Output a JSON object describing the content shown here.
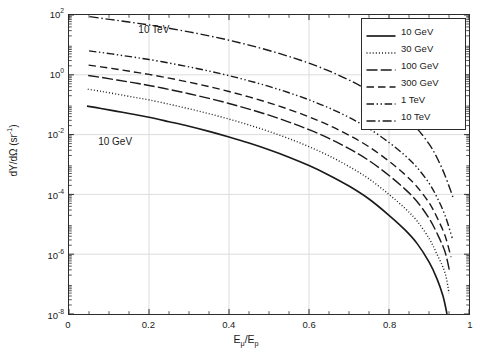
{
  "chart_data": {
    "type": "line",
    "title": "",
    "xlabel": "E_mu / E_p",
    "xlabel_main": "E",
    "xlabel_sub1": "μ",
    "xlabel_mid": "/E",
    "xlabel_sub2": "p",
    "ylabel": "dY/dΩ (sr^-1)",
    "ylabel_main": "dY/dΩ (sr",
    "ylabel_sup": "-1",
    "ylabel_tail": ")",
    "xlim": [
      0,
      1
    ],
    "ylim": [
      1e-08,
      100
    ],
    "yscale": "log",
    "xscale": "linear",
    "grid": true,
    "grid_color": "#d9d9d9",
    "axis_color": "#2b2b2b",
    "line_color": "#1a1a1a",
    "background": "#ffffff",
    "legend_position": "top-right",
    "xticks": [
      0,
      0.2,
      0.4,
      0.6,
      0.8,
      1
    ],
    "xtick_labels": [
      "0",
      "0.2",
      "0.4",
      "0.6",
      "0.8",
      "1"
    ],
    "yticks": [
      100,
      1,
      0.01,
      0.0001,
      1e-06,
      1e-08
    ],
    "ytick_labels": [
      "10",
      "10",
      "10",
      "10",
      "10",
      "10"
    ],
    "ytick_exponents": [
      "2",
      "0",
      "-2",
      "-4",
      "-6",
      "-8"
    ],
    "annotations": [
      {
        "text": "10 TeV",
        "x": 0.175,
        "y": 30.0
      },
      {
        "text": "10 GeV",
        "x": 0.075,
        "y": 0.0055
      }
    ],
    "series": [
      {
        "name": "10 GeV",
        "dash": "solid",
        "x": [
          0.045,
          0.08,
          0.12,
          0.16,
          0.2,
          0.25,
          0.3,
          0.35,
          0.4,
          0.45,
          0.5,
          0.55,
          0.6,
          0.65,
          0.7,
          0.75,
          0.8,
          0.84,
          0.87,
          0.9,
          0.92,
          0.935,
          0.945
        ],
        "values": [
          0.09,
          0.075,
          0.06,
          0.048,
          0.038,
          0.027,
          0.019,
          0.0128,
          0.0083,
          0.0052,
          0.0031,
          0.00175,
          0.00092,
          0.00044,
          0.00019,
          7e-05,
          2e-05,
          6.5e-06,
          2.3e-06,
          5.5e-07,
          1.5e-07,
          4e-08,
          1e-08
        ]
      },
      {
        "name": "30 GeV",
        "dash": "dotted",
        "x": [
          0.047,
          0.08,
          0.12,
          0.16,
          0.2,
          0.25,
          0.3,
          0.35,
          0.4,
          0.45,
          0.5,
          0.55,
          0.6,
          0.65,
          0.7,
          0.75,
          0.8,
          0.84,
          0.87,
          0.9,
          0.92,
          0.94,
          0.95
        ],
        "values": [
          0.33,
          0.28,
          0.225,
          0.18,
          0.145,
          0.104,
          0.073,
          0.05,
          0.033,
          0.021,
          0.0127,
          0.00735,
          0.00395,
          0.00195,
          0.00086,
          0.00033,
          0.0001,
          3.4e-05,
          1.3e-05,
          3.4e-06,
          1e-06,
          2.4e-07,
          5e-08
        ]
      },
      {
        "name": "100 GeV",
        "dash": "longdash-dot",
        "x": [
          0.048,
          0.08,
          0.12,
          0.16,
          0.2,
          0.25,
          0.3,
          0.35,
          0.4,
          0.45,
          0.5,
          0.55,
          0.6,
          0.65,
          0.7,
          0.75,
          0.8,
          0.84,
          0.87,
          0.9,
          0.92,
          0.94,
          0.952
        ],
        "values": [
          0.95,
          0.82,
          0.67,
          0.545,
          0.44,
          0.325,
          0.233,
          0.163,
          0.11,
          0.0715,
          0.0445,
          0.0263,
          0.0146,
          0.00745,
          0.0034,
          0.00135,
          0.00043,
          0.00015,
          5.8e-05,
          1.6e-05,
          5e-06,
          1.2e-06,
          2.5e-07
        ]
      },
      {
        "name": "300 GeV",
        "dash": "dashed",
        "x": [
          0.049,
          0.08,
          0.12,
          0.16,
          0.2,
          0.25,
          0.3,
          0.35,
          0.4,
          0.45,
          0.5,
          0.55,
          0.6,
          0.65,
          0.7,
          0.75,
          0.8,
          0.84,
          0.87,
          0.9,
          0.92,
          0.94,
          0.955
        ],
        "values": [
          2.1,
          1.85,
          1.53,
          1.26,
          1.03,
          0.775,
          0.565,
          0.402,
          0.276,
          0.182,
          0.1155,
          0.0695,
          0.0392,
          0.0204,
          0.00955,
          0.0039,
          0.00129,
          0.00046,
          0.00018,
          5.3e-05,
          1.7e-05,
          4.2e-06,
          8e-07
        ]
      },
      {
        "name": "1 TeV",
        "dash": "dash-dot-dot",
        "x": [
          0.05,
          0.08,
          0.12,
          0.16,
          0.2,
          0.25,
          0.3,
          0.35,
          0.4,
          0.45,
          0.5,
          0.55,
          0.6,
          0.65,
          0.7,
          0.75,
          0.8,
          0.84,
          0.87,
          0.9,
          0.92,
          0.94,
          0.958
        ],
        "values": [
          6.3,
          5.6,
          4.7,
          3.92,
          3.25,
          2.48,
          1.84,
          1.335,
          0.935,
          0.63,
          0.408,
          0.251,
          0.1455,
          0.078,
          0.0377,
          0.0159,
          0.00545,
          0.002,
          0.0008,
          0.00024,
          8e-05,
          2e-05,
          3.5e-06
        ]
      },
      {
        "name": "10 TeV",
        "dash": "dash-dot",
        "x": [
          0.052,
          0.08,
          0.12,
          0.16,
          0.2,
          0.25,
          0.3,
          0.35,
          0.4,
          0.45,
          0.5,
          0.55,
          0.6,
          0.65,
          0.7,
          0.75,
          0.8,
          0.84,
          0.87,
          0.9,
          0.92,
          0.94,
          0.96
        ],
        "values": [
          88.0,
          78.0,
          66.0,
          55.5,
          46.5,
          36.0,
          27.2,
          20.1,
          14.35,
          9.85,
          6.5,
          4.1,
          2.44,
          1.345,
          0.67,
          0.292,
          0.1035,
          0.039,
          0.016,
          0.0049,
          0.00168,
          0.00043,
          8e-05
        ]
      }
    ]
  },
  "legend": {
    "entries": [
      {
        "label": "10 GeV",
        "dash": "solid"
      },
      {
        "label": "30 GeV",
        "dash": "dotted"
      },
      {
        "label": "100 GeV",
        "dash": "longdash-dot"
      },
      {
        "label": "300 GeV",
        "dash": "dashed"
      },
      {
        "label": "1 TeV",
        "dash": "dash-dot-dot"
      },
      {
        "label": "10 TeV",
        "dash": "dash-dot"
      }
    ]
  }
}
